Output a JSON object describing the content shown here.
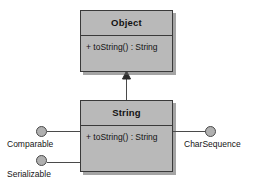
{
  "diagram": {
    "type": "uml-class-diagram",
    "background_color": "#ffffff",
    "box_fill_color": "#b9b9b9",
    "box_border_color": "#3a3a3a",
    "line_color": "#4a4a4a"
  },
  "classes": [
    {
      "name": "Object",
      "methods": [
        "+ toString() : String"
      ]
    },
    {
      "name": "String",
      "methods": [
        "+ toString() : String"
      ]
    }
  ],
  "interfaces": [
    {
      "label": "Comparable"
    },
    {
      "label": "Serializable"
    },
    {
      "label": "CharSequence"
    }
  ],
  "relationships": [
    {
      "kind": "generalization",
      "from": "String",
      "to": "Object",
      "arrowhead": "solid-triangle"
    }
  ]
}
